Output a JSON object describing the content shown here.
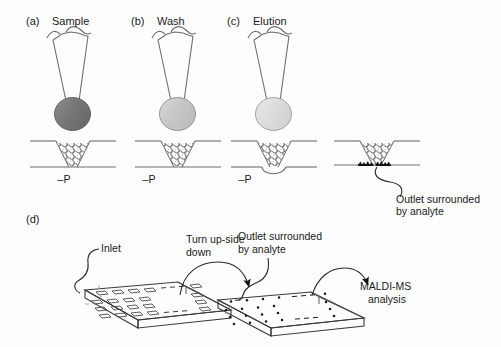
{
  "figure": {
    "panels": [
      {
        "tag": "(a)",
        "title": "Sample",
        "pressure_label": "–P",
        "droplet_color": "#787878"
      },
      {
        "tag": "(b)",
        "title": "Wash",
        "pressure_label": "–P",
        "droplet_color": "#c9c9c9"
      },
      {
        "tag": "(c)",
        "title": "Elution",
        "pressure_label": "–P",
        "droplet_color": "#dcdcdc"
      }
    ],
    "panel_d": {
      "tag": "(d)"
    },
    "annotations": {
      "outlet_top_line1": "Outlet surrounded",
      "outlet_top_line2": "by analyte",
      "inlet": "Inlet",
      "turn_line1": "Turn up-side",
      "turn_line2": "down",
      "outlet_plate_line1": "Outlet surrounded",
      "outlet_plate_line2": "by analyte",
      "maldi_line1": "MALDI-MS",
      "maldi_line2": "analysis"
    }
  },
  "colors": {
    "line": "#6e6e6e",
    "dark_line": "#3a3a3a",
    "bead_fill": "#ffffff",
    "analyte": "#1a1a1a",
    "plate_fill": "#ffffff"
  }
}
